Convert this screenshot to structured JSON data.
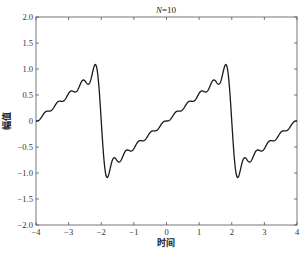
{
  "chart_data": {
    "type": "line",
    "title": "N=10",
    "title_var": "N",
    "title_value": "=10",
    "xlabel": "时间",
    "ylabel": "幅值",
    "xlim": [
      -4,
      4
    ],
    "ylim": [
      -2.0,
      2.0
    ],
    "xticks": [
      -4,
      -3,
      -2,
      -1,
      0,
      1,
      2,
      3,
      4
    ],
    "xtick_labels": [
      "−4",
      "−3",
      "−2",
      "−1",
      "0",
      "1",
      "2",
      "3",
      "4"
    ],
    "yticks": [
      2.0,
      1.5,
      1.0,
      0.5,
      0,
      -0.5,
      -1.0,
      -1.5,
      -2.0
    ],
    "ytick_labels": [
      "2.0",
      "1.5",
      "1.0",
      "0.5",
      "0",
      "−0.5",
      "−1.0",
      "−1.5",
      "−2.0"
    ],
    "grid": false,
    "legend": null,
    "series": [
      {
        "name": "Fourier series sawtooth approximation (N=10 harmonics)",
        "description": "Sawtooth wave of period 4, amplitude 1, rising from -1 to 1 and jumping down at t=±2; Gibbs overshoot ≈1.09 / -1.09",
        "harmonics": 10,
        "period": 4,
        "peaks": [
          {
            "x": -2.18,
            "y": 1.09
          },
          {
            "x": -1.82,
            "y": -1.09
          },
          {
            "x": 1.82,
            "y": 1.09
          },
          {
            "x": 2.18,
            "y": -1.09
          }
        ],
        "sample_points": [
          {
            "x": -4,
            "y": 0.0
          },
          {
            "x": -3.5,
            "y": 0.22
          },
          {
            "x": -3.0,
            "y": 0.45
          },
          {
            "x": -2.5,
            "y": 0.72
          },
          {
            "x": -2.18,
            "y": 1.09
          },
          {
            "x": -2.0,
            "y": 0.0
          },
          {
            "x": -1.82,
            "y": -1.09
          },
          {
            "x": -1.5,
            "y": -0.72
          },
          {
            "x": -1.0,
            "y": -0.55
          },
          {
            "x": -0.5,
            "y": -0.22
          },
          {
            "x": 0,
            "y": 0.0
          },
          {
            "x": 0.5,
            "y": 0.22
          },
          {
            "x": 1.0,
            "y": 0.45
          },
          {
            "x": 1.5,
            "y": 0.72
          },
          {
            "x": 1.82,
            "y": 1.09
          },
          {
            "x": 2.0,
            "y": 0.0
          },
          {
            "x": 2.18,
            "y": -1.09
          },
          {
            "x": 2.5,
            "y": -0.72
          },
          {
            "x": 3.0,
            "y": -0.55
          },
          {
            "x": 3.5,
            "y": -0.22
          },
          {
            "x": 4.0,
            "y": 0.0
          }
        ],
        "color": "#1a1a1a"
      }
    ]
  },
  "colors": {
    "line": "#1a1a1a",
    "axis": "#555555",
    "background": "#ffffff"
  }
}
